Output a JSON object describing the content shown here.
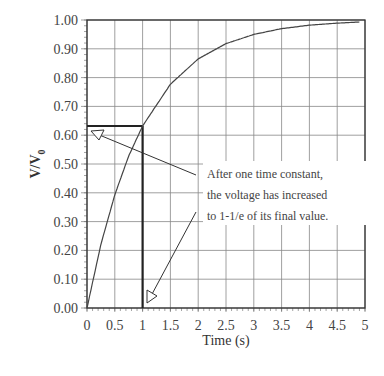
{
  "chart_data": {
    "type": "line",
    "title": "",
    "xlabel": "Time (s)",
    "ylabel": "V/V0",
    "ylabel_main": "V/V",
    "ylabel_sub": "0",
    "xlim": [
      0,
      5
    ],
    "ylim": [
      0,
      1
    ],
    "grid": true,
    "x_ticks": [
      "0",
      "0.5",
      "1",
      "1.5",
      "2",
      "2.5",
      "3",
      "3.5",
      "4",
      "4.5",
      "5"
    ],
    "y_ticks": [
      "0.00",
      "0.10",
      "0.20",
      "0.30",
      "0.40",
      "0.50",
      "0.60",
      "0.70",
      "0.80",
      "0.90",
      "1.00"
    ],
    "series": [
      {
        "name": "V/V0 = 1 - e^(-t/τ), τ = 1 s",
        "x": [
          0,
          0.25,
          0.5,
          0.75,
          1,
          1.5,
          2,
          2.5,
          3,
          3.5,
          4,
          4.5,
          4.9
        ],
        "values": [
          0,
          0.221,
          0.393,
          0.528,
          0.632,
          0.777,
          0.865,
          0.918,
          0.95,
          0.97,
          0.982,
          0.989,
          0.993
        ]
      }
    ],
    "markers": {
      "time_constant_x": 1,
      "value_at_time_constant": 0.632
    },
    "annotation": {
      "lines": [
        "After one time constant,",
        "the voltage has increased",
        "to 1-1/e of its final value."
      ]
    }
  }
}
